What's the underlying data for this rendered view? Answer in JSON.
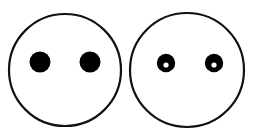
{
  "figure": {
    "canvas": {
      "width": 253,
      "height": 137,
      "background": "#ffffff"
    },
    "stroke_color": "#111111",
    "fill_color": "#000000",
    "pupil_color": "#ffffff",
    "shapes": [
      {
        "id": "left-face",
        "label": "Left face outline",
        "type": "circle-outline",
        "cx": 65,
        "cy": 70,
        "r": 56,
        "stroke_width": 2.2
      },
      {
        "id": "left-face-eye-left",
        "label": "Left face left eye",
        "type": "filled-dot",
        "cx": 40,
        "cy": 62,
        "r": 10.5
      },
      {
        "id": "left-face-eye-right",
        "label": "Left face right eye",
        "type": "filled-dot",
        "cx": 90,
        "cy": 62,
        "r": 10.5
      },
      {
        "id": "right-face",
        "label": "Right face outline",
        "type": "circle-outline",
        "cx": 187,
        "cy": 70,
        "r": 57,
        "stroke_width": 2.2
      },
      {
        "id": "right-face-eye-left",
        "label": "Right face left eye",
        "type": "annulus-dot",
        "cx": 166,
        "cy": 63,
        "r": 9.2,
        "pupil_cx": 166,
        "pupil_cy": 65,
        "pupil_r": 2.6
      },
      {
        "id": "right-face-eye-right",
        "label": "Right face right eye",
        "type": "annulus-dot",
        "cx": 214,
        "cy": 63,
        "r": 9.2,
        "pupil_cx": 214,
        "pupil_cy": 65,
        "pupil_r": 2.6
      }
    ]
  }
}
